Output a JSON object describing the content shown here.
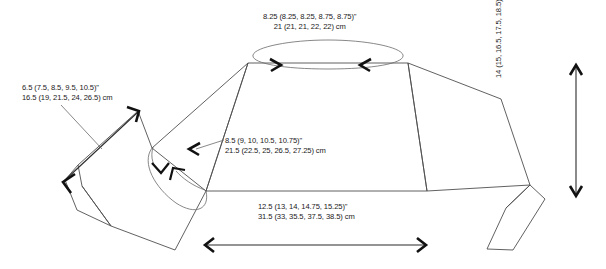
{
  "diagram": {
    "type": "garment-schematic",
    "line_color": "#4f4f4f",
    "arrow_color": "#111111",
    "background_color": "#ffffff",
    "size_note_format": "base (size2, size3, size4, size5)"
  },
  "measurements": {
    "neck_opening": {
      "name": "neck-opening",
      "imperial": "8.25 (8.25, 8.25, 8.75, 8.75)\"",
      "metric": "21 (21, 21, 22, 22) cm"
    },
    "sleeve_length": {
      "name": "sleeve-length",
      "imperial": "6.5 (7.5, 8.5, 9.5, 10.5)\"",
      "metric": "16.5 (19, 21.5, 24, 26.5) cm"
    },
    "upper_body_width": {
      "name": "upper-body-width",
      "imperial": "8.5 (9, 10, 10.5, 10.75)\"",
      "metric": "21.5 (22.5, 25, 26.5, 27.25) cm"
    },
    "hem_width": {
      "name": "hem-width",
      "imperial": "12.5 (13, 14, 14.75, 15.25)\"",
      "metric": "31.5 (33, 35.5, 37.5, 38.5) cm"
    },
    "body_length": {
      "name": "body-length",
      "imperial": "5.5 (5.75, 6.5, 7, 7.25)\"",
      "metric": "14 (15, 16.5, 17.5, 18.5) cm"
    }
  }
}
